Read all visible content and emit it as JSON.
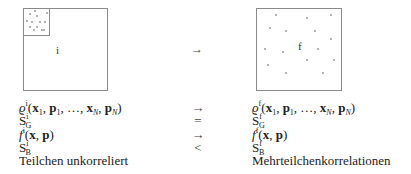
{
  "diagram": {
    "left_box": {
      "label": "i",
      "inner_box_dots": 12
    },
    "transition_arrow": "→",
    "right_box": {
      "label": "f",
      "dots": 15
    }
  },
  "rows": [
    {
      "left": {
        "base": "ϱ",
        "sup": "i",
        "args": "(x₁, p₁, …, x_N, p_N)"
      },
      "relation": "→",
      "right": {
        "base": "ϱ",
        "sup": "f",
        "args": "(x₁, p₁, …, x_N, p_N)"
      }
    },
    {
      "left": {
        "base": "S",
        "sup": "i",
        "sub": "G"
      },
      "relation": "=",
      "right": {
        "base": "S",
        "sup": "f",
        "sub": "G"
      }
    },
    {
      "left": {
        "base": "f",
        "sup": "i",
        "args": "(x, p)"
      },
      "relation": "→",
      "right": {
        "base": "f",
        "sup": "f",
        "args": "(x, p)"
      }
    },
    {
      "left": {
        "base": "S",
        "sup": "i",
        "sub": "B"
      },
      "relation": "<",
      "right": {
        "base": "S",
        "sup": "f",
        "sub": "B"
      }
    },
    {
      "left": {
        "text": "Teilchen unkorreliert"
      },
      "relation": "",
      "right": {
        "text": "Mehrteilchenkorrelationen"
      }
    }
  ]
}
